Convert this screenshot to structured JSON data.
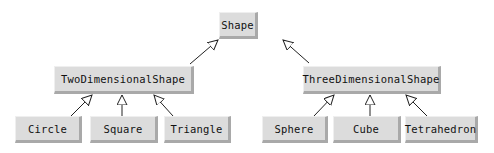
{
  "diagram": {
    "type": "class-hierarchy",
    "root": {
      "label": "Shape",
      "box": [
        219,
        12,
        39,
        27
      ]
    },
    "level2": [
      {
        "label": "TwoDimensionalShape",
        "box": [
          54,
          66,
          140,
          28
        ]
      },
      {
        "label": "ThreeDimensionalShape",
        "box": [
          303,
          66,
          138,
          28
        ]
      }
    ],
    "level3": [
      {
        "label": "Circle",
        "parent": "TwoDimensionalShape",
        "box": [
          15,
          116,
          67,
          27
        ]
      },
      {
        "label": "Square",
        "parent": "TwoDimensionalShape",
        "box": [
          90,
          116,
          68,
          27
        ]
      },
      {
        "label": "Triangle",
        "parent": "TwoDimensionalShape",
        "box": [
          164,
          116,
          67,
          27
        ]
      },
      {
        "label": "Sphere",
        "parent": "ThreeDimensionalShape",
        "box": [
          262,
          116,
          66,
          27
        ]
      },
      {
        "label": "Cube",
        "parent": "ThreeDimensionalShape",
        "box": [
          333,
          116,
          68,
          27
        ]
      },
      {
        "label": "Tetrahedron",
        "parent": "ThreeDimensionalShape",
        "box": [
          405,
          116,
          73,
          27
        ]
      }
    ],
    "edges": [
      {
        "from": "TwoDimensionalShape",
        "to": "Shape",
        "arrow": "hollow-triangle"
      },
      {
        "from": "ThreeDimensionalShape",
        "to": "Shape",
        "arrow": "hollow-triangle"
      },
      {
        "from": "Circle",
        "to": "TwoDimensionalShape",
        "arrow": "hollow-triangle"
      },
      {
        "from": "Square",
        "to": "TwoDimensionalShape",
        "arrow": "hollow-triangle"
      },
      {
        "from": "Triangle",
        "to": "TwoDimensionalShape",
        "arrow": "hollow-triangle"
      },
      {
        "from": "Sphere",
        "to": "ThreeDimensionalShape",
        "arrow": "hollow-triangle"
      },
      {
        "from": "Cube",
        "to": "ThreeDimensionalShape",
        "arrow": "hollow-triangle"
      },
      {
        "from": "Tetrahedron",
        "to": "ThreeDimensionalShape",
        "arrow": "hollow-triangle"
      }
    ],
    "colors": {
      "box_fill": "#dcdcdc",
      "box_shadow": "#a9a9a9",
      "line": "#222222"
    }
  }
}
